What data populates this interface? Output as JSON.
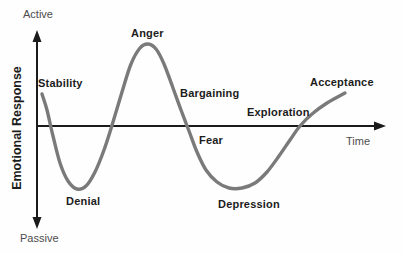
{
  "figure": {
    "background": "#fefefe",
    "axis_color": "#1b1b1b",
    "curve_color": "#7a7a7a",
    "stage_label_color": "#1c1c1c",
    "axis_label_color": "#4c4c4c"
  },
  "chart_data": {
    "type": "line",
    "title": "",
    "xlabel": "Time",
    "ylabel": "Emotional Response",
    "y_top_label": "Active",
    "y_bottom_label": "Passive",
    "grid": false,
    "legend": false,
    "axes": {
      "y_axis_x": 37,
      "y_axis_top": 30,
      "y_axis_bottom": 229,
      "x_axis_y": 126,
      "x_axis_left": 37,
      "x_axis_right": 386
    },
    "curve_points": [
      [
        42,
        94
      ],
      [
        47,
        110
      ],
      [
        53,
        136
      ],
      [
        60,
        163
      ],
      [
        68,
        181
      ],
      [
        77,
        189
      ],
      [
        86,
        186
      ],
      [
        95,
        172
      ],
      [
        104,
        150
      ],
      [
        113,
        122
      ],
      [
        122,
        92
      ],
      [
        131,
        64
      ],
      [
        140,
        48
      ],
      [
        148,
        44
      ],
      [
        156,
        49
      ],
      [
        164,
        64
      ],
      [
        173,
        88
      ],
      [
        181,
        110
      ],
      [
        189,
        131
      ],
      [
        197,
        152
      ],
      [
        206,
        170
      ],
      [
        217,
        182
      ],
      [
        229,
        188
      ],
      [
        242,
        188
      ],
      [
        255,
        183
      ],
      [
        267,
        172
      ],
      [
        279,
        156
      ],
      [
        290,
        140
      ],
      [
        300,
        126
      ],
      [
        312,
        114
      ],
      [
        327,
        103
      ],
      [
        345,
        93
      ]
    ],
    "stages": [
      {
        "label": "Stability",
        "x": 38,
        "y": 77,
        "phase": "above-axis-start"
      },
      {
        "label": "Denial",
        "x": 66,
        "y": 195,
        "phase": "first-trough"
      },
      {
        "label": "Anger",
        "x": 131,
        "y": 27,
        "phase": "peak"
      },
      {
        "label": "Bargaining",
        "x": 180,
        "y": 87,
        "phase": "descending"
      },
      {
        "label": "Fear",
        "x": 199,
        "y": 134,
        "phase": "below-axis"
      },
      {
        "label": "Depression",
        "x": 218,
        "y": 198,
        "phase": "second-trough"
      },
      {
        "label": "Exploration",
        "x": 247,
        "y": 106,
        "phase": "rising"
      },
      {
        "label": "Acceptance",
        "x": 310,
        "y": 76,
        "phase": "above-axis-end"
      }
    ]
  }
}
